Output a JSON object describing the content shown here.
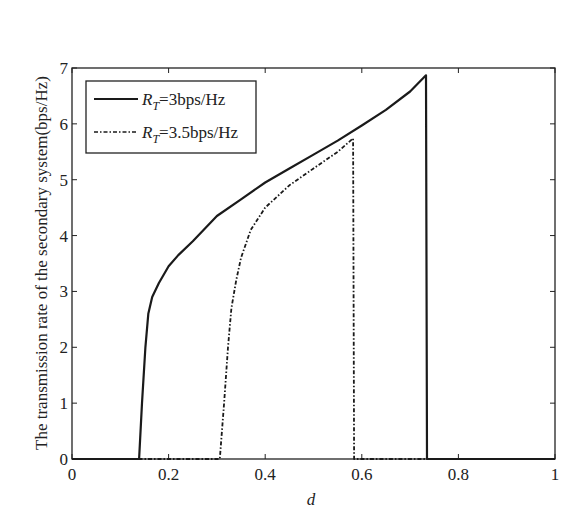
{
  "chart_data": {
    "type": "line",
    "title": "",
    "xlabel": "d",
    "ylabel": "The transmission rate of the secondary system(bps/Hz)",
    "xlim": [
      0,
      1
    ],
    "ylim": [
      0,
      7
    ],
    "grid": false,
    "legend_position": "upper left",
    "x_ticks": [
      "0",
      "0.2",
      "0.4",
      "0.6",
      "0.8",
      "1"
    ],
    "y_ticks": [
      "0",
      "1",
      "2",
      "3",
      "4",
      "5",
      "6",
      "7"
    ],
    "series": [
      {
        "name": "R_T=3bps/Hz",
        "legend_main": "R",
        "legend_sub": "T",
        "legend_rest": "=3bps/Hz",
        "style": "solid",
        "color": "#1a1a1a",
        "x": [
          0,
          0.139,
          0.145,
          0.152,
          0.158,
          0.166,
          0.18,
          0.2,
          0.22,
          0.25,
          0.3,
          0.35,
          0.4,
          0.45,
          0.5,
          0.55,
          0.6,
          0.65,
          0.7,
          0.733,
          0.735,
          1.0
        ],
        "y": [
          0,
          0,
          1.0,
          2.0,
          2.6,
          2.9,
          3.15,
          3.45,
          3.65,
          3.9,
          4.35,
          4.65,
          4.95,
          5.2,
          5.45,
          5.7,
          5.97,
          6.25,
          6.58,
          6.87,
          0,
          0
        ]
      },
      {
        "name": "R_T=3.5bps/Hz",
        "legend_main": "R",
        "legend_sub": "T",
        "legend_rest": "=3.5bps/Hz",
        "style": "dash-dot",
        "color": "#1a1a1a",
        "x": [
          0,
          0.306,
          0.315,
          0.323,
          0.33,
          0.34,
          0.35,
          0.37,
          0.4,
          0.45,
          0.5,
          0.55,
          0.582,
          0.584,
          1.0
        ],
        "y": [
          0,
          0,
          1.0,
          2.0,
          2.7,
          3.2,
          3.6,
          4.1,
          4.5,
          4.9,
          5.2,
          5.5,
          5.74,
          0,
          0
        ]
      }
    ]
  }
}
